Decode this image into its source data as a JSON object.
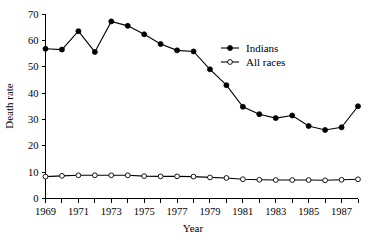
{
  "chart_data": {
    "type": "line",
    "title": "",
    "xlabel": "Year",
    "ylabel": "Death rate",
    "xlim": [
      1969,
      1988
    ],
    "ylim": [
      0,
      70
    ],
    "ytick_step": 10,
    "yticks": [
      0,
      10,
      20,
      30,
      40,
      50,
      60,
      70
    ],
    "ytick_labels": [
      "0",
      "10",
      "20",
      "30",
      "40",
      "50",
      "60",
      "70"
    ],
    "xticks": [
      1969,
      1970,
      1971,
      1972,
      1973,
      1974,
      1975,
      1976,
      1977,
      1978,
      1979,
      1980,
      1981,
      1982,
      1983,
      1984,
      1985,
      1986,
      1987,
      1988
    ],
    "xtick_labels_shown": [
      "1969",
      "1971",
      "1973",
      "1975",
      "1977",
      "1979",
      "1981",
      "1983",
      "1985",
      "1987"
    ],
    "x": [
      1969,
      1970,
      1971,
      1972,
      1973,
      1974,
      1975,
      1976,
      1977,
      1978,
      1979,
      1980,
      1981,
      1982,
      1983,
      1984,
      1985,
      1986,
      1987,
      1988
    ],
    "grid": false,
    "legend_position": "upper-right",
    "series": [
      {
        "name": "Indians",
        "marker": "filled-circle",
        "color": "#000000",
        "values": [
          56.8,
          56.5,
          63.5,
          55.6,
          67.2,
          65.5,
          62.3,
          58.6,
          56.2,
          55.8,
          49.0,
          43.0,
          34.8,
          32.0,
          30.5,
          31.5,
          27.5,
          26.0,
          27.0,
          35.0
        ]
      },
      {
        "name": "All races",
        "marker": "open-circle",
        "color": "#000000",
        "values": [
          8.3,
          8.6,
          8.8,
          8.8,
          8.8,
          8.8,
          8.5,
          8.4,
          8.4,
          8.3,
          8.0,
          7.8,
          7.3,
          7.1,
          7.0,
          7.0,
          7.0,
          6.9,
          7.1,
          7.3
        ]
      }
    ],
    "legend": [
      {
        "label": "Indians",
        "marker": "filled-circle"
      },
      {
        "label": "All races",
        "marker": "open-circle"
      }
    ]
  }
}
